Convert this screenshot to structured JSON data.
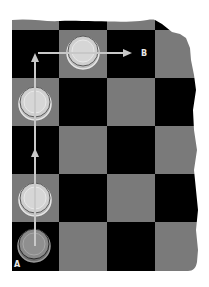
{
  "diagram": {
    "colors": {
      "dark_square": "#000000",
      "light_square": "#7a7a7a",
      "piece_light_fill": "#cfcfcf",
      "piece_dark_fill": "#8a8a8a",
      "piece_ring": "#e6e6e6",
      "arrow": "#c8c8c8",
      "label": "#e8e8e8",
      "background": "#ffffff"
    },
    "board": {
      "columns": 4,
      "rows": [
        [
          "light",
          "dark",
          "light",
          "dark"
        ],
        [
          "dark",
          "light",
          "dark",
          "light"
        ],
        [
          "light",
          "dark",
          "light",
          "dark"
        ],
        [
          "dark",
          "light",
          "dark",
          "light"
        ],
        [
          "light",
          "dark",
          "light",
          "dark"
        ],
        [
          "dark",
          "light",
          "dark",
          "light"
        ]
      ],
      "note": "top row is a partial strip; right edge is torn"
    },
    "pieces": [
      {
        "row": 1,
        "col": 1,
        "style": "light"
      },
      {
        "row": 2,
        "col": 0,
        "style": "light"
      },
      {
        "row": 4,
        "col": 0,
        "style": "light"
      },
      {
        "row": 5,
        "col": 0,
        "style": "dark"
      }
    ],
    "labels": {
      "start": "A",
      "end": "B"
    },
    "path": {
      "from": "A",
      "to": "B",
      "segments": [
        "up along left column",
        "right along row 1"
      ]
    }
  }
}
